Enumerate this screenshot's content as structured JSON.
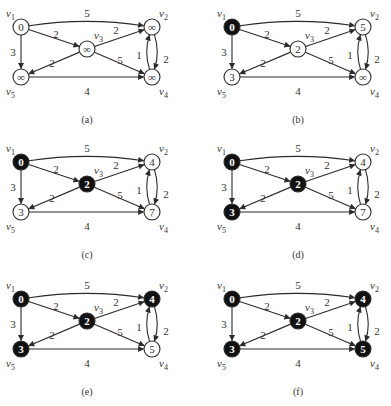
{
  "figure": {
    "colors": {
      "line": "#2b2b2b",
      "node_fill_unvisited": "#ffffff",
      "node_fill_visited": "#111111",
      "text_dark": "#333333",
      "text_light": "#ffffff",
      "background": "#ffffff"
    },
    "graph": {
      "vertices": [
        {
          "id": "v1",
          "label": "v",
          "sub": "1",
          "x": 21,
          "y": 27,
          "label_pos": "top-left"
        },
        {
          "id": "v2",
          "label": "v",
          "sub": "2",
          "x": 152,
          "y": 27,
          "label_pos": "top-right"
        },
        {
          "id": "v3",
          "label": "v",
          "sub": "3",
          "x": 87,
          "y": 49,
          "label_pos": "top-right"
        },
        {
          "id": "v4",
          "label": "v",
          "sub": "4",
          "x": 152,
          "y": 77,
          "label_pos": "bottom-right"
        },
        {
          "id": "v5",
          "label": "v",
          "sub": "5",
          "x": 21,
          "y": 77,
          "label_pos": "bottom-left"
        }
      ],
      "edges": [
        {
          "from": "v1",
          "to": "v2",
          "weight": "5",
          "curve": -10,
          "lx": 87,
          "ly": 13
        },
        {
          "from": "v1",
          "to": "v3",
          "weight": "2",
          "curve": 0,
          "lx": 56,
          "ly": 34
        },
        {
          "from": "v1",
          "to": "v5",
          "weight": "3",
          "curve": 0,
          "lx": 13,
          "ly": 52
        },
        {
          "from": "v3",
          "to": "v2",
          "weight": "2",
          "curve": 0,
          "lx": 116,
          "ly": 30
        },
        {
          "from": "v3",
          "to": "v5",
          "weight": "2",
          "curve": 0,
          "lx": 52,
          "ly": 63
        },
        {
          "from": "v3",
          "to": "v4",
          "weight": "5",
          "curve": 0,
          "lx": 120,
          "ly": 60
        },
        {
          "from": "v5",
          "to": "v4",
          "weight": "4",
          "curve": 0,
          "lx": 87,
          "ly": 91
        },
        {
          "from": "v2",
          "to": "v4",
          "weight": "1",
          "curve": -8,
          "lx": 139,
          "ly": 55
        },
        {
          "from": "v4",
          "to": "v2",
          "weight": "2",
          "curve": -8,
          "lx": 166,
          "ly": 59
        }
      ]
    },
    "panels": [
      {
        "id": "a",
        "caption": "(a)",
        "offset_x": 0,
        "offset_y": 0,
        "nodes": {
          "v1": {
            "value": "0",
            "visited": false
          },
          "v2": {
            "value": "∞",
            "visited": false
          },
          "v3": {
            "value": "∞",
            "visited": false
          },
          "v4": {
            "value": "∞",
            "visited": false
          },
          "v5": {
            "value": "∞",
            "visited": false
          }
        }
      },
      {
        "id": "b",
        "caption": "(b)",
        "offset_x": 211,
        "offset_y": 0,
        "nodes": {
          "v1": {
            "value": "0",
            "visited": true
          },
          "v2": {
            "value": "5",
            "visited": false
          },
          "v3": {
            "value": "2",
            "visited": false
          },
          "v4": {
            "value": "∞",
            "visited": false
          },
          "v5": {
            "value": "3",
            "visited": false
          }
        }
      },
      {
        "id": "c",
        "caption": "(c)",
        "offset_x": 0,
        "offset_y": 135,
        "nodes": {
          "v1": {
            "value": "0",
            "visited": true
          },
          "v2": {
            "value": "4",
            "visited": false
          },
          "v3": {
            "value": "2",
            "visited": true
          },
          "v4": {
            "value": "7",
            "visited": false
          },
          "v5": {
            "value": "3",
            "visited": false
          }
        }
      },
      {
        "id": "d",
        "caption": "(d)",
        "offset_x": 211,
        "offset_y": 135,
        "nodes": {
          "v1": {
            "value": "0",
            "visited": true
          },
          "v2": {
            "value": "4",
            "visited": false
          },
          "v3": {
            "value": "2",
            "visited": true
          },
          "v4": {
            "value": "7",
            "visited": false
          },
          "v5": {
            "value": "3",
            "visited": true
          }
        }
      },
      {
        "id": "e",
        "caption": "(e)",
        "offset_x": 0,
        "offset_y": 272,
        "nodes": {
          "v1": {
            "value": "0",
            "visited": true
          },
          "v2": {
            "value": "4",
            "visited": true
          },
          "v3": {
            "value": "2",
            "visited": true
          },
          "v4": {
            "value": "5",
            "visited": false
          },
          "v5": {
            "value": "3",
            "visited": true
          }
        }
      },
      {
        "id": "f",
        "caption": "(f)",
        "offset_x": 211,
        "offset_y": 272,
        "nodes": {
          "v1": {
            "value": "0",
            "visited": true
          },
          "v2": {
            "value": "4",
            "visited": true
          },
          "v3": {
            "value": "2",
            "visited": true
          },
          "v4": {
            "value": "5",
            "visited": true
          },
          "v5": {
            "value": "3",
            "visited": true
          }
        }
      }
    ],
    "caption_y": 119,
    "caption_x": 87,
    "node_radius": 8
  }
}
